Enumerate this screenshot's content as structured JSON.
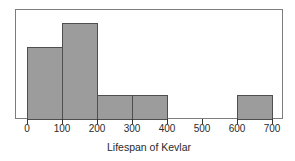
{
  "chart_data": {
    "type": "bar",
    "subtype": "histogram",
    "title": "",
    "xlabel": "Lifespan of Kevlar",
    "ylabel": "",
    "bin_edges": [
      0,
      100,
      200,
      300,
      400,
      500,
      600,
      700
    ],
    "x_tick_labels": [
      "0",
      "100",
      "200",
      "300",
      "400",
      "500",
      "600",
      "700"
    ],
    "values": [
      3,
      4,
      1,
      1,
      0,
      0,
      1
    ],
    "xlim": [
      0,
      700
    ],
    "grid": false,
    "y_axis_shown": false,
    "legend": null,
    "colors": {
      "bar_fill": "#9c9c9c",
      "bar_border": "#4f4f4f",
      "frame_border": "#7d7d7d",
      "tick": "#333333",
      "text": "#2a2a2a",
      "background": "#ffffff"
    }
  }
}
